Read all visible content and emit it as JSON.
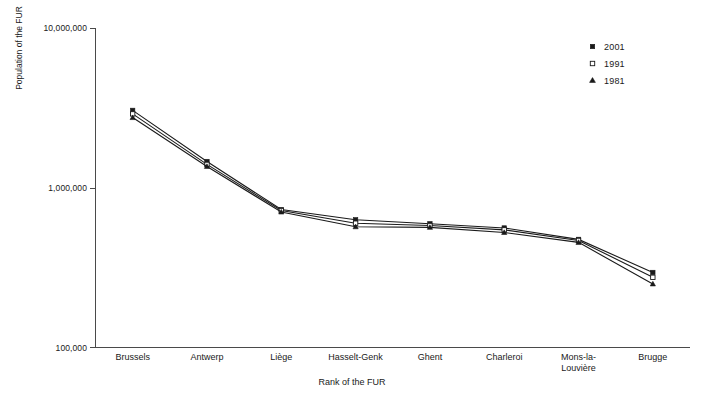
{
  "chart_data": {
    "type": "line",
    "title": "",
    "subtitle": "",
    "xlabel": "Rank of the FUR",
    "ylabel": "Population of the FUR",
    "categories": [
      "Brussels",
      "Antwerp",
      "Liège",
      "Hasselt-Genk",
      "Ghent",
      "Charleroi",
      "Mons-la-Louvière",
      "Brugge"
    ],
    "yscale": "log",
    "ylim": [
      100000,
      10000000
    ],
    "ytick_labels": [
      "10,000,000",
      "1,000,000",
      "100,000"
    ],
    "ytick_values": [
      10000000,
      1000000,
      100000
    ],
    "grid": false,
    "legend_position": "top-right",
    "series": [
      {
        "name": "2001",
        "marker": "filled-square",
        "values": [
          3050000,
          1460000,
          730000,
          630000,
          595000,
          560000,
          475000,
          295000
        ]
      },
      {
        "name": "1991",
        "marker": "open-square",
        "values": [
          2900000,
          1400000,
          720000,
          600000,
          580000,
          545000,
          468000,
          275000
        ]
      },
      {
        "name": "1981",
        "marker": "filled-triangle",
        "values": [
          2750000,
          1360000,
          705000,
          570000,
          565000,
          525000,
          455000,
          250000
        ]
      }
    ],
    "colors": {
      "line": "#1a1a1a",
      "axis": "#4a4a4a",
      "background": "#ffffff"
    }
  }
}
